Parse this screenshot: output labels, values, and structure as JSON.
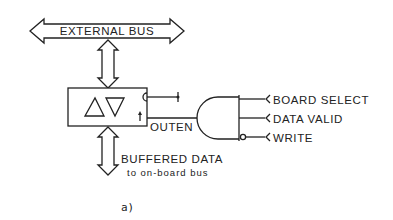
{
  "diagram": {
    "external_bus_label": "EXTERNAL BUS",
    "buffered_data_label": "BUFFERED DATA",
    "buffered_data_sublabel": "to on-board bus",
    "outen_label": "OUTEN",
    "inputs": [
      {
        "label": "BOARD SELECT",
        "inverted": false
      },
      {
        "label": "DATA VALID",
        "inverted": false
      },
      {
        "label": "WRITE",
        "inverted": true
      }
    ],
    "caption": "a)",
    "buffer_symbols": [
      "up-triangle",
      "down-triangle"
    ]
  }
}
